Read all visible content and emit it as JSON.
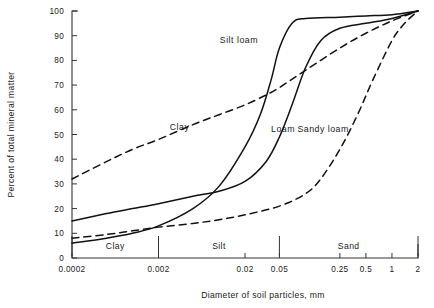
{
  "chart_data": {
    "type": "line",
    "title": "",
    "xlabel": "Diameter of soil particles, mm",
    "ylabel": "Percent of total mineral matter",
    "x_scale": "log",
    "xlim": [
      0.0002,
      2
    ],
    "ylim": [
      0,
      100
    ],
    "grid": false,
    "legend_position": "inline-annotations",
    "x_ticks": [
      {
        "value": 0.0002,
        "label": "0.0002"
      },
      {
        "value": 0.002,
        "label": "0.002"
      },
      {
        "value": 0.02,
        "label": "0.02"
      },
      {
        "value": 0.05,
        "label": "0.05"
      },
      {
        "value": 0.25,
        "label": "0.25"
      },
      {
        "value": 0.5,
        "label": "0.5"
      },
      {
        "value": 1,
        "label": "1"
      },
      {
        "value": 2,
        "label": "2"
      }
    ],
    "y_ticks": [
      {
        "value": 0,
        "label": "0"
      },
      {
        "value": 10,
        "label": "10"
      },
      {
        "value": 20,
        "label": "20"
      },
      {
        "value": 30,
        "label": "30"
      },
      {
        "value": 40,
        "label": "40"
      },
      {
        "value": 50,
        "label": "50"
      },
      {
        "value": 60,
        "label": "60"
      },
      {
        "value": 70,
        "label": "70"
      },
      {
        "value": 80,
        "label": "80"
      },
      {
        "value": 90,
        "label": "90"
      },
      {
        "value": 100,
        "label": "100"
      }
    ],
    "size_classes": [
      {
        "name": "Clay",
        "from": 0.0002,
        "to": 0.002
      },
      {
        "name": "Silt",
        "from": 0.002,
        "to": 0.05
      },
      {
        "name": "Sand",
        "from": 0.05,
        "to": 2
      }
    ],
    "class_dividers": [
      0.002,
      0.05
    ],
    "series": [
      {
        "name": "Clay",
        "style": "dashed",
        "color": "#111111",
        "label_text": "Clay",
        "label_x": 0.0035,
        "label_y": 52,
        "x": [
          0.0002,
          0.0005,
          0.001,
          0.002,
          0.005,
          0.01,
          0.02,
          0.035,
          0.05,
          0.1,
          0.25,
          0.5,
          1,
          2
        ],
        "y": [
          32,
          39,
          44,
          48,
          54,
          58,
          62,
          66,
          69,
          76,
          85,
          91,
          96,
          100
        ]
      },
      {
        "name": "Silt loam",
        "style": "solid",
        "color": "#111111",
        "label_text": "Silt loam",
        "label_x": 0.017,
        "label_y": 87,
        "x": [
          0.0002,
          0.0005,
          0.001,
          0.002,
          0.005,
          0.01,
          0.02,
          0.03,
          0.04,
          0.05,
          0.07,
          0.1,
          0.25,
          0.5,
          1,
          2
        ],
        "y": [
          6,
          8,
          10,
          13,
          20,
          29,
          45,
          58,
          72,
          85,
          95,
          97,
          97.5,
          98,
          98.5,
          100
        ]
      },
      {
        "name": "Loam",
        "style": "solid",
        "color": "#111111",
        "label_text": "Loam",
        "label_x": 0.055,
        "label_y": 51,
        "x": [
          0.0002,
          0.0005,
          0.001,
          0.002,
          0.005,
          0.01,
          0.02,
          0.035,
          0.05,
          0.07,
          0.1,
          0.15,
          0.25,
          0.5,
          1,
          2
        ],
        "y": [
          15,
          18,
          20,
          22,
          25,
          27,
          31,
          39,
          49,
          62,
          77,
          88,
          93,
          95,
          97,
          100
        ]
      },
      {
        "name": "Sandy loam",
        "style": "dashed",
        "color": "#111111",
        "label_text": "Sandy loam",
        "label_x": 0.16,
        "label_y": 51,
        "x": [
          0.0002,
          0.0005,
          0.001,
          0.002,
          0.005,
          0.01,
          0.02,
          0.05,
          0.1,
          0.15,
          0.25,
          0.4,
          0.6,
          1,
          1.4,
          2
        ],
        "y": [
          8,
          9.5,
          11,
          12.5,
          14,
          15.5,
          17.5,
          21,
          26,
          32,
          44,
          58,
          72,
          88,
          95,
          100
        ]
      }
    ]
  },
  "axis_titles": {
    "x": "Diameter of soil particles, mm",
    "y": "Percent of total mineral matter"
  }
}
